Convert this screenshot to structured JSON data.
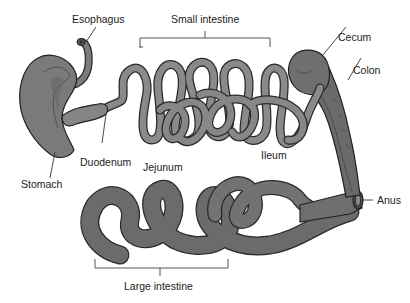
{
  "diagram": {
    "colors": {
      "background": "#ffffff",
      "organ_fill": "#7a7a7a",
      "organ_dark": "#5e5e5e",
      "organ_light": "#8e8e8e",
      "small_intestine": "#858585",
      "large_intestine": "#6b6b6b",
      "outline": "#222222",
      "label_text": "#222222",
      "leader_line": "#333333"
    },
    "labels": {
      "esophagus": "Esophagus",
      "small_intestine": "Small intestine",
      "cecum": "Cecum",
      "colon": "Colon",
      "stomach": "Stomach",
      "duodenum": "Duodenum",
      "jejunum": "Jejunum",
      "ileum": "Ileum",
      "anus": "Anus",
      "large_intestine": "Large intestine"
    },
    "brackets": {
      "small_intestine": {
        "x1": 140,
        "x2": 270,
        "y": 38,
        "label_x": 205,
        "label_y": 22
      },
      "large_intestine": {
        "x1": 95,
        "x2": 228,
        "y": 268,
        "label_x": 160,
        "label_y": 290
      }
    }
  }
}
